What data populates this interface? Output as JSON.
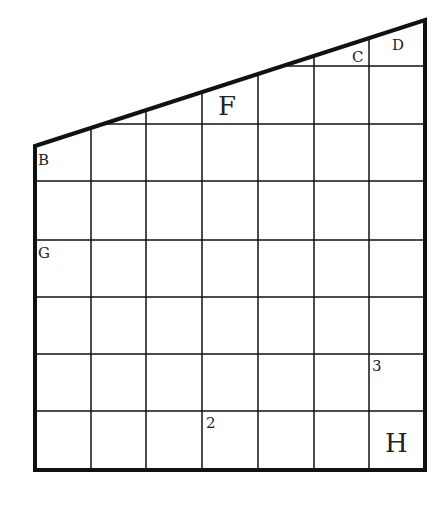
{
  "diagram": {
    "type": "grid-puzzle-trapezoid",
    "columns": 7,
    "rows_full": 6,
    "outline": {
      "top_left": [
        35,
        146
      ],
      "top_right": [
        425,
        20
      ],
      "bottom_right": [
        425,
        470
      ],
      "bottom_left": [
        35,
        470
      ]
    },
    "vertical_lines_x": [
      91,
      146,
      202,
      258,
      314,
      369
    ],
    "horizontal_lines_y": [
      181,
      240,
      297,
      354,
      411
    ],
    "partial_lines": [
      {
        "y": 124,
        "x_from": 91,
        "x_to": 425
      },
      {
        "y": 66,
        "x_from": 291,
        "x_to": 425
      }
    ],
    "colors": {
      "line": "#111111",
      "background": "#ffffff"
    },
    "labels": [
      {
        "id": "B",
        "text": "B",
        "x": 38,
        "y": 165,
        "size": 15
      },
      {
        "id": "G",
        "text": "G",
        "x": 38,
        "y": 258,
        "size": 15
      },
      {
        "id": "C",
        "text": "C",
        "x": 352,
        "y": 62,
        "size": 15
      },
      {
        "id": "D",
        "text": "D",
        "x": 392,
        "y": 50,
        "size": 15
      },
      {
        "id": "F",
        "text": "F",
        "x": 218,
        "y": 115,
        "size": 26
      },
      {
        "id": "2",
        "text": "2",
        "x": 206,
        "y": 428,
        "size": 15
      },
      {
        "id": "3",
        "text": "3",
        "x": 372,
        "y": 371,
        "size": 15
      },
      {
        "id": "H",
        "text": "H",
        "x": 385,
        "y": 452,
        "size": 26
      }
    ]
  }
}
